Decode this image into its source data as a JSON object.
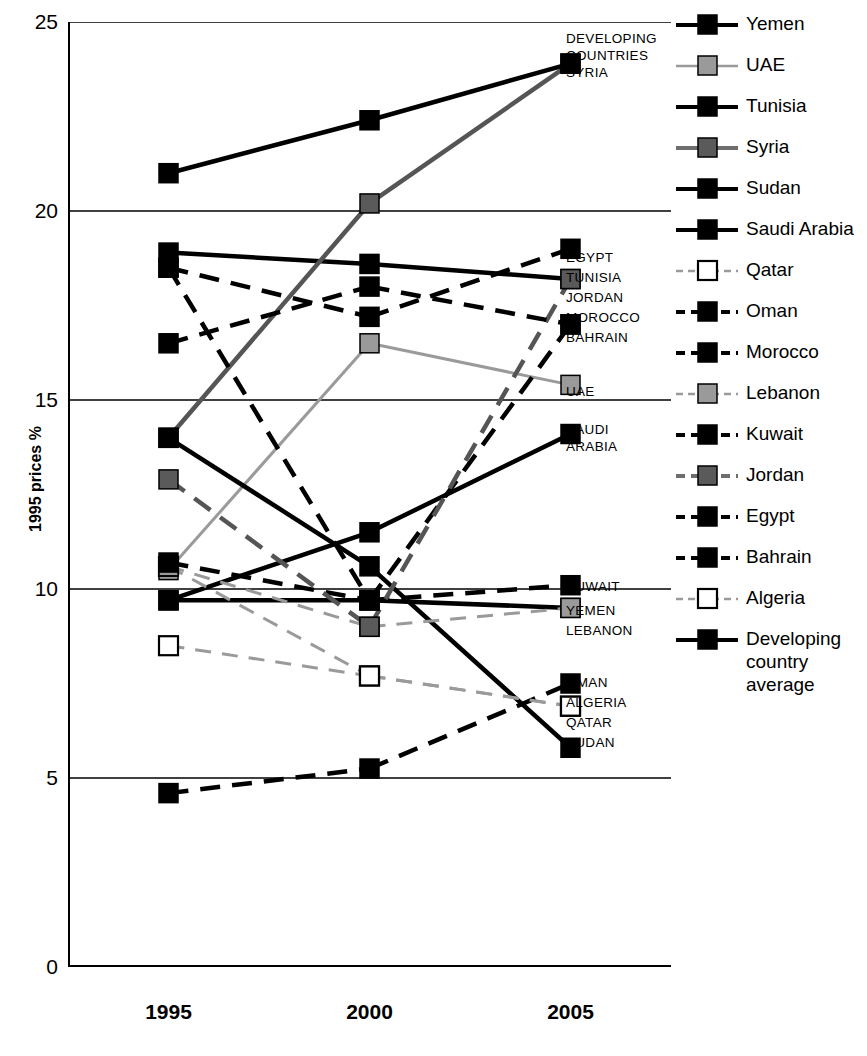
{
  "chart_data": {
    "type": "line",
    "title": "",
    "subtitle": "",
    "xlabel": "",
    "ylabel": "1995 prices %",
    "x": [
      "1995",
      "2000",
      "2005"
    ],
    "xlim": [
      0,
      3
    ],
    "ylim": [
      0,
      25
    ],
    "yticks": [
      0,
      5,
      10,
      15,
      20,
      25
    ],
    "grid": "horizontal",
    "legend_position": "right",
    "series": [
      {
        "name": "Yemen",
        "values": [
          9.7,
          9.7,
          9.5
        ],
        "line": "solid",
        "marker": "filled-black",
        "color": "#000000"
      },
      {
        "name": "UAE",
        "values": [
          10.5,
          16.5,
          15.4
        ],
        "line": "solid",
        "marker": "filled-gray",
        "color": "#9a9a9a"
      },
      {
        "name": "Tunisia",
        "values": [
          18.9,
          18.6,
          18.2
        ],
        "line": "solid",
        "marker": "filled-black",
        "color": "#000000"
      },
      {
        "name": "Syria",
        "values": [
          14.0,
          20.2,
          23.9
        ],
        "line": "solid",
        "marker": "filled-dkgray",
        "color": "#555555"
      },
      {
        "name": "Sudan",
        "values": [
          14.0,
          10.6,
          5.8
        ],
        "line": "solid",
        "marker": "filled-black",
        "color": "#000000"
      },
      {
        "name": "Saudi Arabia",
        "values": [
          9.7,
          11.5,
          14.1
        ],
        "line": "solid",
        "marker": "filled-black",
        "color": "#000000"
      },
      {
        "name": "Qatar",
        "values": [
          10.6,
          7.7,
          6.9
        ],
        "line": "dashed",
        "marker": "open-white",
        "color": "#9a9a9a"
      },
      {
        "name": "Oman",
        "values": [
          4.6,
          5.25,
          7.5
        ],
        "line": "dashed",
        "marker": "filled-black",
        "color": "#000000"
      },
      {
        "name": "Morocco",
        "values": [
          18.5,
          9.7,
          17.0
        ],
        "line": "dashed",
        "marker": "filled-black",
        "color": "#000000"
      },
      {
        "name": "Lebanon",
        "values": [
          10.6,
          9.0,
          9.5
        ],
        "line": "dashed",
        "marker": "filled-gray",
        "color": "#9a9a9a"
      },
      {
        "name": "Kuwait",
        "values": [
          10.7,
          9.7,
          10.1
        ],
        "line": "dashed",
        "marker": "filled-black",
        "color": "#000000"
      },
      {
        "name": "Jordan",
        "values": [
          12.9,
          9.0,
          18.2
        ],
        "line": "dashed",
        "marker": "filled-dkgray",
        "color": "#555555"
      },
      {
        "name": "Egypt",
        "values": [
          18.5,
          17.2,
          19.0
        ],
        "line": "dashed",
        "marker": "filled-black",
        "color": "#000000"
      },
      {
        "name": "Bahrain",
        "values": [
          16.5,
          18.0,
          17.0
        ],
        "line": "dashed",
        "marker": "filled-black",
        "color": "#000000"
      },
      {
        "name": "Algeria",
        "values": [
          8.5,
          7.7,
          6.9
        ],
        "line": "dashed",
        "marker": "open-white",
        "color": "#9a9a9a"
      },
      {
        "name": "Developing country average",
        "values": [
          21.0,
          22.4,
          23.9
        ],
        "line": "solid",
        "marker": "filled-black",
        "color": "#000000"
      }
    ]
  },
  "axes": {
    "y_title": "1995 prices %",
    "y_ticks": [
      "25",
      "20",
      "15",
      "10",
      "5",
      "0"
    ],
    "x_ticks": [
      "1995",
      "2000",
      "2005"
    ]
  },
  "annotations": [
    {
      "id": "ann-developing-syria",
      "text": "DEVELOPING\nCOUNTRIES\nSYRIA"
    },
    {
      "id": "ann-egypt",
      "text": "EGYPT"
    },
    {
      "id": "ann-tunisia",
      "text": "TUNISIA"
    },
    {
      "id": "ann-jordan",
      "text": "JORDAN"
    },
    {
      "id": "ann-morocco",
      "text": "MOROCCO"
    },
    {
      "id": "ann-bahrain",
      "text": "BAHRAIN"
    },
    {
      "id": "ann-uae",
      "text": "UAE"
    },
    {
      "id": "ann-saudi-arabia",
      "text": "SAUDI\nARABIA"
    },
    {
      "id": "ann-kuwait",
      "text": "KUWAIT"
    },
    {
      "id": "ann-yemen",
      "text": "YEMEN"
    },
    {
      "id": "ann-lebanon",
      "text": "LEBANON"
    },
    {
      "id": "ann-oman",
      "text": "OMAN"
    },
    {
      "id": "ann-algeria",
      "text": "ALGERIA"
    },
    {
      "id": "ann-qatar",
      "text": "QATAR"
    },
    {
      "id": "ann-sudan",
      "text": "SUDAN"
    }
  ],
  "legend": {
    "items": [
      {
        "label": "Yemen",
        "line": "solid",
        "marker": "filled-black",
        "color": "#000000"
      },
      {
        "label": "UAE",
        "line": "solid",
        "marker": "filled-gray",
        "color": "#9a9a9a"
      },
      {
        "label": "Tunisia",
        "line": "solid",
        "marker": "filled-black",
        "color": "#000000"
      },
      {
        "label": "Syria",
        "line": "solid",
        "marker": "filled-dkgray",
        "color": "#6e6e6e"
      },
      {
        "label": "Sudan",
        "line": "solid",
        "marker": "filled-black",
        "color": "#000000"
      },
      {
        "label": "Saudi Arabia",
        "line": "solid",
        "marker": "filled-black",
        "color": "#000000"
      },
      {
        "label": "Qatar",
        "line": "dashed",
        "marker": "open-white",
        "color": "#9a9a9a"
      },
      {
        "label": "Oman",
        "line": "dashed",
        "marker": "filled-black",
        "color": "#000000"
      },
      {
        "label": "Morocco",
        "line": "dashed",
        "marker": "filled-black",
        "color": "#000000"
      },
      {
        "label": "Lebanon",
        "line": "dashed",
        "marker": "filled-gray",
        "color": "#9a9a9a"
      },
      {
        "label": "Kuwait",
        "line": "dashed",
        "marker": "filled-black",
        "color": "#000000"
      },
      {
        "label": "Jordan",
        "line": "dashed",
        "marker": "filled-dkgray",
        "color": "#6e6e6e"
      },
      {
        "label": "Egypt",
        "line": "dashed",
        "marker": "filled-black",
        "color": "#000000"
      },
      {
        "label": "Bahrain",
        "line": "dashed",
        "marker": "filled-black",
        "color": "#000000"
      },
      {
        "label": "Algeria",
        "line": "dashed",
        "marker": "open-white",
        "color": "#9a9a9a"
      },
      {
        "label": "Developing\ncountry\naverage",
        "line": "solid",
        "marker": "filled-black",
        "color": "#000000"
      }
    ]
  }
}
